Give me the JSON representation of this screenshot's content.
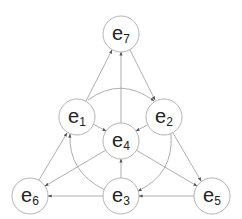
{
  "diagram": {
    "type": "directed-graph",
    "nodes": [
      {
        "id": "e7",
        "label": "e",
        "sub": "7",
        "x": 121,
        "y": 34
      },
      {
        "id": "e1",
        "label": "e",
        "sub": "1",
        "x": 77,
        "y": 117
      },
      {
        "id": "e2",
        "label": "e",
        "sub": "2",
        "x": 164,
        "y": 117
      },
      {
        "id": "e4",
        "label": "e",
        "sub": "4",
        "x": 121,
        "y": 141
      },
      {
        "id": "e6",
        "label": "e",
        "sub": "6",
        "x": 30,
        "y": 196
      },
      {
        "id": "e3",
        "label": "e",
        "sub": "3",
        "x": 121,
        "y": 196
      },
      {
        "id": "e5",
        "label": "e",
        "sub": "5",
        "x": 212,
        "y": 196
      }
    ],
    "edges": [
      {
        "from": "e1",
        "to": "e7"
      },
      {
        "from": "e4",
        "to": "e7"
      },
      {
        "from": "e7",
        "to": "e2"
      },
      {
        "from": "e1",
        "to": "e2",
        "curved": true
      },
      {
        "from": "e1",
        "to": "e4"
      },
      {
        "from": "e2",
        "to": "e4"
      },
      {
        "from": "e6",
        "to": "e1"
      },
      {
        "from": "e4",
        "to": "e6"
      },
      {
        "from": "e3",
        "to": "e6"
      },
      {
        "from": "e3",
        "to": "e4"
      },
      {
        "from": "e3",
        "to": "e1",
        "curved": true
      },
      {
        "from": "e2",
        "to": "e3",
        "curved": true
      },
      {
        "from": "e4",
        "to": "e5"
      },
      {
        "from": "e2",
        "to": "e5"
      },
      {
        "from": "e5",
        "to": "e3"
      }
    ]
  }
}
